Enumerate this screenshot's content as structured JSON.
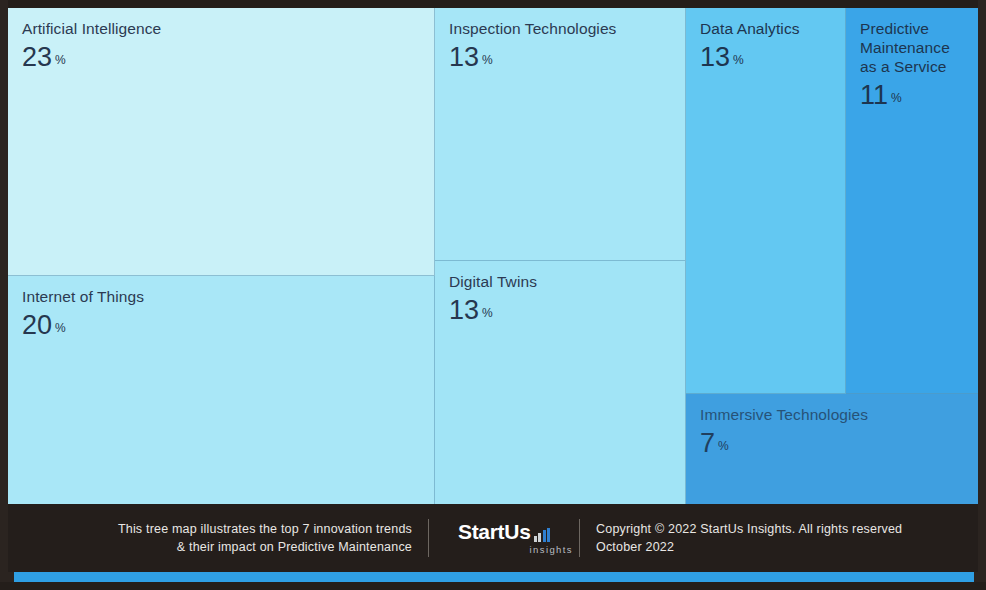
{
  "chart_data": {
    "type": "treemap",
    "unit": "%",
    "categories": [
      "Artificial Intelligence",
      "Internet of Things",
      "Inspection Technologies",
      "Digital Twins",
      "Data Analytics",
      "Predictive Maintenance as a Service",
      "Immersive Technologies"
    ],
    "values": [
      23,
      20,
      13,
      13,
      13,
      11,
      7
    ],
    "legend": "",
    "grid": false,
    "tiles": [
      {
        "label": "Artificial Intelligence",
        "value": "23",
        "pct": "%",
        "color": "#c9f1f8"
      },
      {
        "label": "Internet of Things",
        "value": "20",
        "pct": "%",
        "color": "#a9e7f7"
      },
      {
        "label": "Inspection Technologies",
        "value": "13",
        "pct": "%",
        "color": "#a6e6f7"
      },
      {
        "label": "Digital Twins",
        "value": "13",
        "pct": "%",
        "color": "#a1e4f6"
      },
      {
        "label": "Data Analytics",
        "value": "13",
        "pct": "%",
        "color": "#63c8f2"
      },
      {
        "label": "Predictive\nMaintenance\nas a Service",
        "value": "11",
        "pct": "%",
        "color": "#3aa5e8"
      },
      {
        "label": "Immersive Technologies",
        "value": "7",
        "pct": "%",
        "color": "#3f9fe0"
      }
    ]
  },
  "footer": {
    "caption": "This tree map illustrates the top 7 innovation trends\n& their impact on Predictive Maintenance",
    "brand_name": "StartUs",
    "brand_sub": "insights",
    "copyright": "Copyright © 2022 StartUs Insights. All rights reserved\nOctober 2022"
  },
  "colors": {
    "footer_bg": "#241e1b",
    "accent_strip": "#2f9fe4",
    "ink": "#26374f"
  }
}
